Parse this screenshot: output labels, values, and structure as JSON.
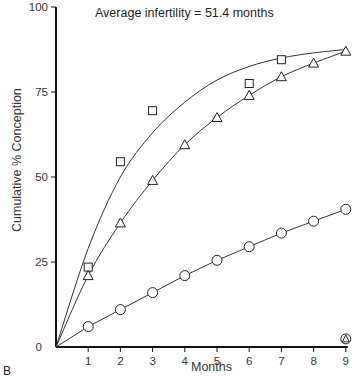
{
  "chart_data": {
    "type": "line",
    "title": "",
    "annotation": "Average infertility = 51.4  months",
    "panel_label": "B",
    "xlabel": "Months",
    "ylabel": "Cumulative % Conception",
    "xlim": [
      0,
      9
    ],
    "ylim": [
      0,
      100
    ],
    "x_ticks": [
      1,
      2,
      3,
      4,
      5,
      6,
      7,
      8,
      9
    ],
    "y_ticks": [
      0,
      25,
      50,
      75,
      100
    ],
    "grid": false,
    "legend": null,
    "series": [
      {
        "name": "squares",
        "marker": "square",
        "x": [
          1,
          2,
          3,
          6,
          7
        ],
        "values": [
          23.5,
          54.5,
          69.5,
          77.5,
          84.5
        ],
        "fit_curve": {
          "x": [
            0,
            1,
            2,
            3,
            4,
            5,
            6,
            7,
            8,
            9
          ],
          "values": [
            0,
            29,
            50,
            63,
            72,
            78.5,
            82.5,
            85,
            86.5,
            87.5
          ]
        }
      },
      {
        "name": "triangles",
        "marker": "triangle",
        "x": [
          1,
          2,
          3,
          4,
          5,
          6,
          7,
          8,
          9
        ],
        "values": [
          21,
          36.5,
          49,
          59.5,
          67.5,
          74,
          79.5,
          83.5,
          87
        ],
        "fit_curve": {
          "x": [
            0,
            1,
            2,
            3,
            4,
            5,
            6,
            7,
            8,
            9
          ],
          "values": [
            0,
            21,
            36.5,
            49,
            59.5,
            67.5,
            74,
            79.5,
            83.5,
            87
          ]
        }
      },
      {
        "name": "circles",
        "marker": "circle",
        "x": [
          1,
          2,
          3,
          4,
          5,
          6,
          7,
          8,
          9
        ],
        "values": [
          6,
          11,
          16,
          21,
          25.5,
          29.5,
          33.5,
          37,
          40.5
        ],
        "fit_curve": {
          "x": [
            0,
            1,
            2,
            3,
            4,
            5,
            6,
            7,
            8,
            9
          ],
          "values": [
            0,
            6,
            11,
            16,
            21,
            25.5,
            29.5,
            33.5,
            37,
            40.5
          ]
        }
      },
      {
        "name": "circle-with-triangle",
        "marker": "circle-triangle",
        "x": [
          9
        ],
        "values": [
          1.5
        ]
      }
    ]
  }
}
